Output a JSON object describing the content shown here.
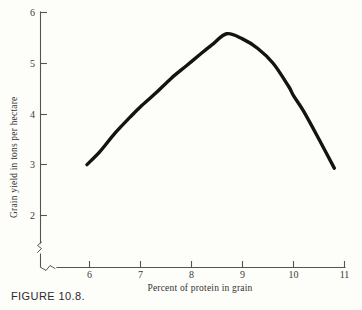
{
  "figure": {
    "caption": "FIGURE 10.8."
  },
  "chart_data": {
    "type": "line",
    "title": "",
    "xlabel": "Percent of protein in grain",
    "ylabel": "Grain yield in tons per hectare",
    "xlim": [
      5.35,
      11.0
    ],
    "ylim": [
      1.62,
      6.0
    ],
    "xticks": [
      6,
      7,
      8,
      9,
      10,
      11
    ],
    "xtick_labels": [
      "6",
      "7",
      "8",
      "9",
      "10",
      "11"
    ],
    "yticks": [
      2,
      3,
      4,
      5,
      6
    ],
    "ytick_labels": [
      "2",
      "3",
      "4",
      "5",
      "6"
    ],
    "grid": false,
    "legend": null,
    "axis_break": {
      "x_axis": true,
      "y_axis": true
    },
    "series": [
      {
        "name": "Grain yield response to protein",
        "x": [
          5.95,
          6.2,
          6.5,
          6.8,
          7.0,
          7.3,
          7.6,
          7.9,
          8.2,
          8.4,
          8.69,
          9.0,
          9.3,
          9.6,
          9.9,
          10.0,
          10.2,
          10.5,
          10.8
        ],
        "y": [
          3.0,
          3.25,
          3.62,
          3.94,
          4.14,
          4.41,
          4.7,
          4.95,
          5.2,
          5.36,
          5.58,
          5.48,
          5.29,
          5.0,
          4.55,
          4.36,
          4.05,
          3.5,
          2.93
        ],
        "color": "#131312",
        "style": "smooth-curve",
        "peak": {
          "x": 8.69,
          "y": 5.58
        }
      }
    ]
  }
}
